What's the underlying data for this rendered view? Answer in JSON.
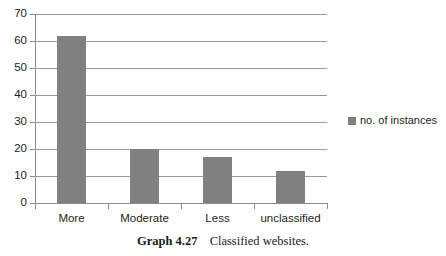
{
  "chart_data": {
    "type": "bar",
    "title": "",
    "subtitle": "",
    "xlabel": "",
    "ylabel": "",
    "categories": [
      "More",
      "Moderate",
      "Less",
      "unclassified"
    ],
    "series": [
      {
        "name": "no. of instances",
        "values": [
          62,
          20,
          17,
          12
        ],
        "color": "#808080"
      }
    ],
    "ylim": [
      0,
      70
    ],
    "yticks": [
      0,
      10,
      20,
      30,
      40,
      50,
      60,
      70
    ],
    "ytick_labels": [
      "0",
      "10",
      "20",
      "30",
      "40",
      "50",
      "60",
      "70"
    ],
    "grid": true,
    "grid_axis": "y",
    "legend": {
      "position": "right",
      "entries": [
        {
          "label": "no. of instances",
          "marker": "square",
          "color": "#808080"
        }
      ]
    }
  },
  "caption": {
    "number": "Graph 4.27",
    "text": "Classified websites."
  },
  "colors": {
    "bar": "#808080",
    "grid": "#9a9a9a",
    "axis": "#8c8c8c",
    "text": "#231f20",
    "background": "#ffffff"
  }
}
